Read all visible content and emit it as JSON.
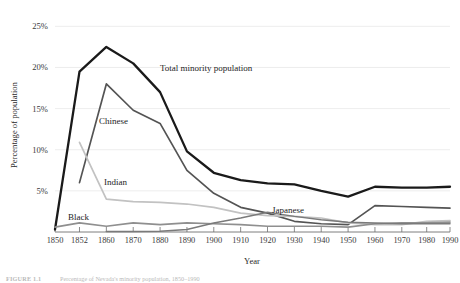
{
  "figure": {
    "caption_label": "FIGURE 1.1",
    "caption_text": "Percentage of Nevada's minority population, 1850–1990"
  },
  "chart_data": {
    "type": "line",
    "title": "",
    "xlabel": "Year",
    "ylabel": "Percentage of population",
    "grid": true,
    "legend": "inline-labels",
    "ylim": [
      0,
      26.5
    ],
    "yticks": [
      5,
      10,
      15,
      20,
      25
    ],
    "ytick_labels": [
      "5%",
      "10%",
      "15%",
      "20%",
      "25%"
    ],
    "categories": [
      "1850",
      "1852",
      "1860",
      "1870",
      "1880",
      "1890",
      "1900",
      "1910",
      "1920",
      "1930",
      "1940",
      "1950",
      "1960",
      "1970",
      "1980",
      "1990"
    ],
    "series": [
      {
        "name": "Total minority population",
        "label": "Total minority population",
        "color": "#1a1a1a",
        "width": 2.3,
        "values": [
          0.3,
          19.5,
          22.5,
          20.5,
          17.0,
          9.8,
          7.2,
          6.3,
          5.9,
          5.8,
          5.0,
          4.3,
          5.5,
          5.4,
          5.4,
          5.5
        ],
        "label_x": 160,
        "label_y": 71
      },
      {
        "name": "Chinese",
        "label": "Chinese",
        "color": "#545454",
        "width": 1.7,
        "values": [
          null,
          6.0,
          18.0,
          14.8,
          13.2,
          7.5,
          4.7,
          3.0,
          2.3,
          1.3,
          1.0,
          0.9,
          3.2,
          3.1,
          3.0,
          2.9
        ],
        "label_x": 99,
        "label_y": 124
      },
      {
        "name": "Indian",
        "label": "Indian",
        "color": "#c2c2c2",
        "width": 1.7,
        "values": [
          null,
          10.9,
          4.0,
          3.7,
          3.6,
          3.4,
          3.0,
          2.3,
          2.0,
          1.9,
          1.7,
          1.1,
          0.9,
          0.9,
          1.3,
          1.4
        ],
        "label_x": 104,
        "label_y": 185
      },
      {
        "name": "Black",
        "label": "Black",
        "color": "#8f8f8f",
        "width": 1.7,
        "values": [
          0.6,
          1.1,
          0.7,
          1.1,
          0.9,
          1.1,
          1.0,
          0.9,
          0.7,
          0.7,
          0.7,
          0.6,
          1.0,
          1.1,
          1.1,
          1.2
        ],
        "label_x": 68,
        "label_y": 220
      },
      {
        "name": "Japanese",
        "label": "Japanese",
        "color": "#7a7a7a",
        "width": 1.5,
        "values": [
          null,
          null,
          0.05,
          0.05,
          0.1,
          0.3,
          1.1,
          1.7,
          2.4,
          1.9,
          1.5,
          1.2,
          1.1,
          1.0,
          1.0,
          1.0
        ],
        "label_x": 272,
        "label_y": 213
      }
    ]
  },
  "axes": {
    "plot_left": 55,
    "plot_right": 450,
    "plot_top": 14,
    "plot_bottom": 232
  }
}
